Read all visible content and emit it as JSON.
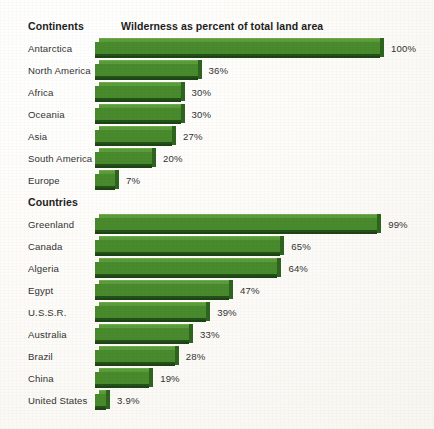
{
  "chart_data": {
    "type": "bar",
    "title": "Wilderness as percent of total land area",
    "orientation": "horizontal",
    "xlabel": "",
    "ylabel": "",
    "xlim": [
      0,
      100
    ],
    "grid": false,
    "legend": null,
    "value_suffix": "%",
    "groups": [
      {
        "name": "Continents",
        "categories": [
          "Antarctica",
          "North America",
          "Africa",
          "Oceania",
          "Asia",
          "South America",
          "Europe"
        ],
        "values": [
          100,
          36,
          30,
          30,
          27,
          20,
          7
        ],
        "labels": [
          "100%",
          "36%",
          "30%",
          "30%",
          "27%",
          "20%",
          "7%"
        ]
      },
      {
        "name": "Countries",
        "categories": [
          "Greenland",
          "Canada",
          "Algeria",
          "Egypt",
          "U.S.S.R.",
          "Australia",
          "Brazil",
          "China",
          "United States"
        ],
        "values": [
          99,
          65,
          64,
          47,
          39,
          33,
          28,
          19,
          3.9
        ],
        "labels": [
          "99%",
          "65%",
          "64%",
          "47%",
          "39%",
          "33%",
          "28%",
          "19%",
          "3.9%"
        ]
      }
    ],
    "colors": {
      "bar_face": "#498a2d",
      "bar_top": "#5c9c3c",
      "bar_side": "#2e6420",
      "bar_shadow": "#1d4415",
      "background": "#fefdfa",
      "text": "#333333"
    }
  },
  "headers": {
    "continents_group": "Continents",
    "countries_group": "Countries",
    "chart_title": "Wilderness as percent of total land area"
  }
}
